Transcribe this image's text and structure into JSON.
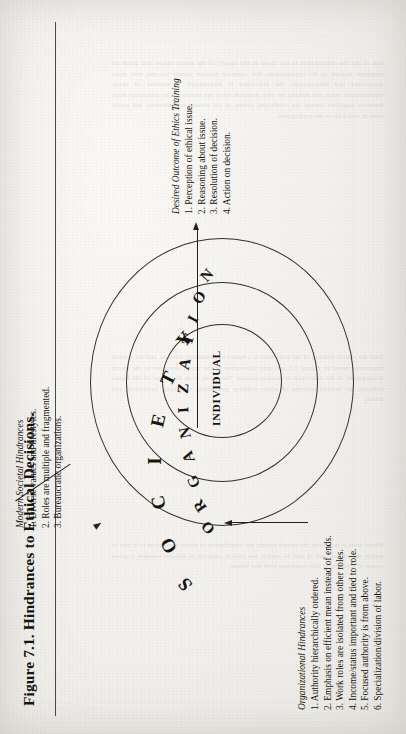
{
  "figure": {
    "title": "Figure 7.1.  Hindrances to Ethical Decisions.",
    "diagram": {
      "type": "concentric-ellipses",
      "rings": [
        {
          "label": "SOCIETY"
        },
        {
          "label": "ORGANIZATION"
        },
        {
          "label": "INDIVIDUAL"
        }
      ]
    },
    "annotations": {
      "societal": {
        "heading": "Modern Societal Hindrances",
        "items": [
          "1. Diverse values and lifestyles.",
          "2. Roles are multiple and fragmented.",
          "3. Bureaucratic organizations."
        ]
      },
      "organizational": {
        "heading": "Organizational Hindrances",
        "items": [
          "1. Authority hierarchically ordered.",
          "2. Emphasis on efficient mean instead of ends.",
          "3. Work roles are isolated from other roles.",
          "4. Income/status important and tied to role.",
          "5. Focused authority is from above.",
          "6. Specialization/division of labor."
        ]
      },
      "outcome": {
        "heading": "Desired Outcome of Ethics Training",
        "items": [
          "1. Perception of ethical issue.",
          "2. Reasoning about issue.",
          "3. Resolution of decision.",
          "4. Action on decision."
        ]
      }
    },
    "colors": {
      "ink": "#16140f",
      "stroke": "#33302b",
      "paper": "#f2f1ee"
    }
  },
  "bleed_through": {
    "col_top": "tion of the the organization is not alone in the supply of the moral values that guide its members. Indeed, as the organizations that compose modern society become ever more specialized and bureaucratic, the individual is increasingly a member of many organizations, each one making its own demands upon the member. The individual must therefore negotiate among the conflicting claims of the several organizations and social roles in which he or she participates.",
    "col_mid": "Thus the ethical training of the individual is a matter of continuing concern, and the several hindrances noted in Figure 7.1 are only illustrative of the many obstacles to the moral development of the individual in modern society. The arrow from the center of the figure indicates the desired outcome of ethics training: perception, reasoning, resolution, and action.",
    "col_bottom": "Where there is no vision, the people perish; the contribution of ethics instruction is in part to supply the vision, and in part to supply the critical capacity to discern whether a given course of action is in fact consistent with that vision."
  }
}
